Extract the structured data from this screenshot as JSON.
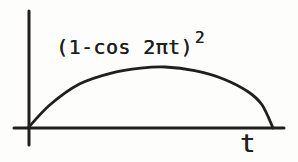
{
  "figure": {
    "ink_color": "#211f1c",
    "background": "#fdfdfc"
  },
  "chart_data": {
    "type": "line",
    "title": "",
    "xlabel": "t",
    "ylabel": "",
    "expression": "(1-cos 2πt)^2",
    "label_base": "(1-cos 2πt)",
    "label_exponent": "2",
    "grid": false,
    "legend": false,
    "axis_tick_labels": [],
    "x_range_shown": [
      0,
      1
    ],
    "curve_points_normalized": {
      "t": [
        0,
        0.09,
        0.21,
        0.34,
        0.46,
        0.56,
        0.68,
        0.8,
        0.9,
        0.955,
        1.0
      ],
      "y": [
        0,
        0.38,
        0.72,
        0.9,
        0.98,
        1.0,
        0.94,
        0.8,
        0.59,
        0.38,
        0
      ]
    }
  }
}
